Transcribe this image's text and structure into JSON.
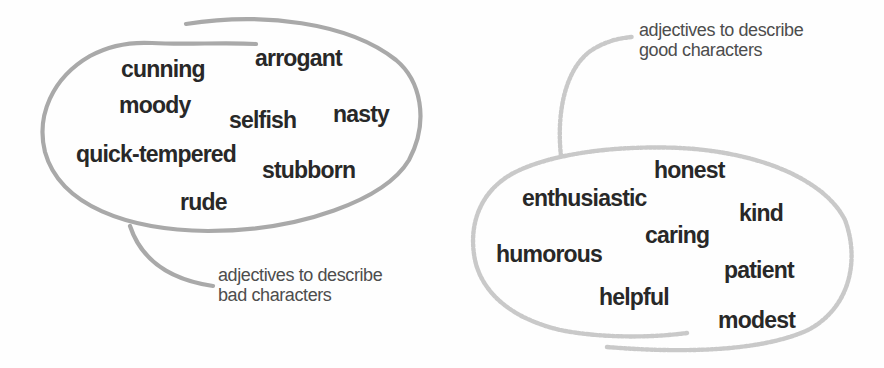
{
  "bubbles": {
    "bad": {
      "caption_line1": "adjectives to describe",
      "caption_line2": "bad characters",
      "stroke_color": "#a9a9a9",
      "words": [
        "cunning",
        "arrogant",
        "moody",
        "selfish",
        "nasty",
        "quick-tempered",
        "stubborn",
        "rude"
      ]
    },
    "good": {
      "caption_line1": "adjectives to describe",
      "caption_line2": "good characters",
      "stroke_color": "#c9c9c9",
      "words": [
        "honest",
        "enthusiastic",
        "kind",
        "caring",
        "humorous",
        "patient",
        "helpful",
        "modest"
      ]
    }
  },
  "colors": {
    "word_text": "#282828",
    "caption_text": "#4d4d4d",
    "background": "#fefefe"
  }
}
